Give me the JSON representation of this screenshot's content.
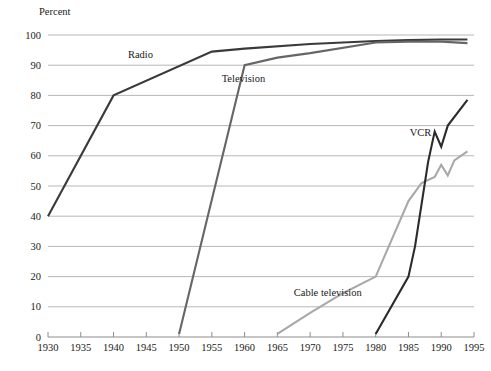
{
  "chart_data": {
    "type": "line",
    "title": "",
    "subtitle": "",
    "xlabel": "",
    "ylabel": "Percent",
    "ylim": [
      0,
      100
    ],
    "xlim": [
      1930,
      1995
    ],
    "grid": true,
    "legend_position": "inline-annotations",
    "y_ticks": [
      0,
      10,
      20,
      30,
      40,
      50,
      60,
      70,
      80,
      90,
      100
    ],
    "y_tick_labels": [
      "0",
      "10",
      "20",
      "30",
      "40",
      "50",
      "60",
      "70",
      "80",
      "90",
      "100"
    ],
    "x_ticks": [
      1930,
      1935,
      1940,
      1945,
      1950,
      1955,
      1960,
      1965,
      1970,
      1975,
      1980,
      1985,
      1990,
      1995
    ],
    "x_tick_labels": [
      "1930",
      "1935",
      "1940",
      "1945",
      "1950",
      "1955",
      "1960",
      "1965",
      "1970",
      "1975",
      "1980",
      "1985",
      "1990",
      "1995"
    ],
    "series": [
      {
        "name": "Radio",
        "color": "#3a3a3a",
        "width": 2.1,
        "label_x": 1942.2,
        "label_y": 92.5,
        "points": [
          [
            1930,
            40
          ],
          [
            1940,
            80
          ],
          [
            1955,
            94.5
          ],
          [
            1960,
            95.5
          ],
          [
            1970,
            97
          ],
          [
            1980,
            98
          ],
          [
            1985,
            98.3
          ],
          [
            1990,
            98.5
          ],
          [
            1994,
            98.5
          ]
        ]
      },
      {
        "name": "Television",
        "color": "#666666",
        "width": 2.1,
        "label_x": 1956.5,
        "label_y": 84.5,
        "points": [
          [
            1950,
            1
          ],
          [
            1960,
            90
          ],
          [
            1965,
            92.5
          ],
          [
            1970,
            94
          ],
          [
            1980,
            97.5
          ],
          [
            1985,
            97.8
          ],
          [
            1990,
            97.8
          ],
          [
            1994,
            97.3
          ]
        ]
      },
      {
        "name": "Cable television",
        "color": "#a8a8a8",
        "width": 2.1,
        "label_x": 1967.5,
        "label_y": 13.5,
        "points": [
          [
            1965,
            1
          ],
          [
            1970,
            8
          ],
          [
            1975,
            14.5
          ],
          [
            1980,
            20
          ],
          [
            1985,
            45
          ],
          [
            1987,
            51
          ],
          [
            1989,
            53
          ],
          [
            1990,
            57
          ],
          [
            1991,
            53.5
          ],
          [
            1992,
            58.5
          ],
          [
            1994,
            61.5
          ]
        ]
      },
      {
        "name": "VCR",
        "color": "#2b2b2b",
        "width": 2.1,
        "label_x": 1985.2,
        "label_y": 66.5,
        "points": [
          [
            1980,
            1
          ],
          [
            1985,
            20
          ],
          [
            1986,
            30
          ],
          [
            1988,
            58
          ],
          [
            1989,
            68
          ],
          [
            1990,
            63
          ],
          [
            1991,
            70
          ],
          [
            1994,
            78.5
          ]
        ]
      }
    ]
  },
  "styling": {
    "grid_color": "#b7b7b7",
    "axis_color": "#8c8c8c",
    "text_color": "#1a1a1a",
    "background": "#ffffff"
  }
}
